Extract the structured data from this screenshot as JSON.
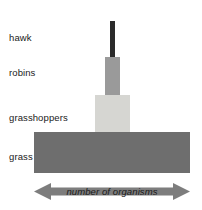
{
  "diagram": {
    "type": "ecological-pyramid",
    "orientation": "vertical-stack",
    "background_color": "#ffffff",
    "levels": [
      {
        "label": "hawk",
        "name": "hawk",
        "trophic_position": 4,
        "relative_width": 5,
        "color": "#2b2b2b"
      },
      {
        "label": "robins",
        "name": "robins",
        "trophic_position": 3,
        "relative_width": 15,
        "color": "#9a9a9a"
      },
      {
        "label": "grasshoppers",
        "name": "grasshoppers",
        "trophic_position": 2,
        "relative_width": 35,
        "color": "#d6d6d2"
      },
      {
        "label": "grass",
        "name": "grass",
        "trophic_position": 1,
        "relative_width": 156,
        "color": "#6e6e6e"
      }
    ],
    "axis": {
      "label": "number of organisms",
      "arrow_style": "double-headed",
      "color": "#7d7d7d"
    }
  }
}
